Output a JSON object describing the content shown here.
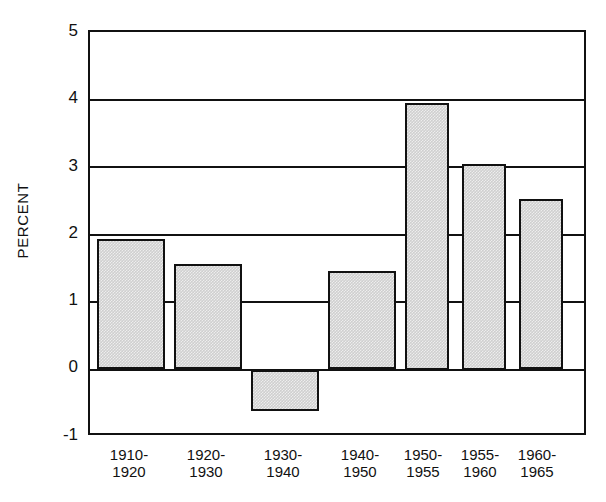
{
  "chart_data": {
    "type": "bar",
    "title": "",
    "subtitle": "",
    "xlabel": "",
    "ylabel": "PERCENT",
    "ylim": [
      -1,
      5
    ],
    "yticks": [
      5,
      4,
      3,
      2,
      1,
      0,
      -1
    ],
    "ytick_labels": [
      "5",
      "4",
      "3",
      "2",
      "1",
      "0",
      "-1"
    ],
    "grid": true,
    "legend": "none",
    "categories": [
      "1910-1920",
      "1920-1930",
      "1930-1940",
      "1940-1950",
      "1950-1955",
      "1955-1960",
      "1960-1965"
    ],
    "category_lines": [
      {
        "line1": "1910-",
        "line2": "1920"
      },
      {
        "line1": "1920-",
        "line2": "1930"
      },
      {
        "line1": "1930-",
        "line2": "1940"
      },
      {
        "line1": "1940-",
        "line2": "1950"
      },
      {
        "line1": "1950-",
        "line2": "1955"
      },
      {
        "line1": "1955-",
        "line2": "1960"
      },
      {
        "line1": "1960-",
        "line2": "1965"
      }
    ],
    "values": [
      1.93,
      1.56,
      -0.61,
      1.46,
      3.95,
      3.05,
      2.52
    ],
    "bar_color": "#cfcfcf",
    "bar_edge_color": "#111111",
    "axis_color": "#111111",
    "background_color": "#ffffff"
  },
  "geometry": {
    "plot_left": 88,
    "plot_top": 30,
    "plot_width": 498,
    "plot_height": 405,
    "y_min": -1,
    "y_max": 5,
    "bars": [
      {
        "left": 7,
        "width": 68
      },
      {
        "left": 84,
        "width": 68
      },
      {
        "left": 161,
        "width": 68
      },
      {
        "left": 238,
        "width": 68
      },
      {
        "left": 315,
        "width": 44
      },
      {
        "left": 372,
        "width": 44
      },
      {
        "left": 429,
        "width": 44
      }
    ],
    "x_label_positions": [
      {
        "left": 88,
        "width": 82
      },
      {
        "left": 165,
        "width": 82
      },
      {
        "left": 242,
        "width": 82
      },
      {
        "left": 319,
        "width": 82
      },
      {
        "left": 390,
        "width": 66
      },
      {
        "left": 447,
        "width": 66
      },
      {
        "left": 504,
        "width": 66
      }
    ],
    "y_label_tops": [
      22,
      89,
      157,
      224,
      291,
      358,
      426
    ]
  }
}
